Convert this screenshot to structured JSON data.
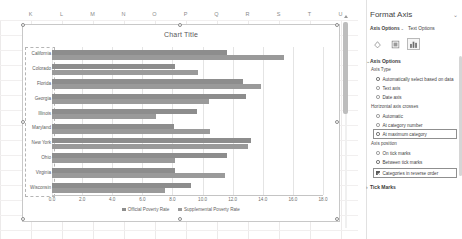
{
  "spreadsheet": {
    "column_headers": [
      "K",
      "L",
      "M",
      "N",
      "O",
      "P",
      "Q",
      "R",
      "S",
      "T",
      "U"
    ]
  },
  "chart_data": {
    "type": "bar",
    "orientation": "horizontal",
    "title": "Chart Title",
    "xlabel": "",
    "ylabel": "",
    "xlim": [
      0.0,
      18.0
    ],
    "xticks": [
      "0.0",
      "2.0",
      "4.0",
      "6.0",
      "8.0",
      "10.0",
      "12.0",
      "14.0",
      "16.0",
      "18.0"
    ],
    "grid": true,
    "legend_position": "bottom",
    "categories": [
      "California",
      "Colorado",
      "Florida",
      "Georgia",
      "Illinois",
      "Maryland",
      "New York",
      "Ohio",
      "Virginia",
      "Wisconsin"
    ],
    "series": [
      {
        "name": "Official Poverty Rate",
        "color": "#8d8d8d",
        "values": [
          11.6,
          8.2,
          12.7,
          12.9,
          9.6,
          8.1,
          13.2,
          11.6,
          8.2,
          9.2
        ]
      },
      {
        "name": "Supplemental Poverty Rate",
        "color": "#9a9a9a",
        "values": [
          15.4,
          9.7,
          13.9,
          10.4,
          6.9,
          10.5,
          13.0,
          8.2,
          11.5,
          7.5
        ]
      }
    ]
  },
  "format_pane": {
    "title": "Format Axis",
    "close_icon": "close-icon",
    "tabs": [
      {
        "label": "Axis Options",
        "chevron": "⌄",
        "active": true
      },
      {
        "label": "Text Options",
        "chevron": "",
        "active": false
      }
    ],
    "icon_buttons": [
      {
        "name": "fill-line-icon",
        "selected": false
      },
      {
        "name": "effects-icon",
        "selected": false
      },
      {
        "name": "axis-options-icon",
        "selected": true
      }
    ],
    "sections": [
      {
        "header": "Axis Options",
        "chevron": "⌄",
        "expanded": true,
        "groups": [
          {
            "label": "Axis Type",
            "control": "radio",
            "options": [
              {
                "label": "Automatically select based on data",
                "checked": true
              },
              {
                "label": "Text axis",
                "checked": false
              },
              {
                "label": "Date axis",
                "checked": false
              }
            ]
          },
          {
            "label": "Horizontal axis crosses",
            "control": "radio",
            "options": [
              {
                "label": "Automatic",
                "checked": false
              },
              {
                "label": "At category number",
                "checked": false
              },
              {
                "label": "At maximum category",
                "checked": true,
                "highlighted": true
              }
            ]
          },
          {
            "label": "Axis position",
            "control": "radio",
            "options": [
              {
                "label": "On tick marks",
                "checked": false
              },
              {
                "label": "Between tick marks",
                "checked": true
              }
            ]
          },
          {
            "label": "",
            "control": "checkbox",
            "options": [
              {
                "label": "Categories in reverse order",
                "checked": true,
                "highlighted": true
              }
            ]
          }
        ]
      },
      {
        "header": "Tick Marks",
        "chevron": "›",
        "expanded": false,
        "groups": []
      }
    ]
  }
}
